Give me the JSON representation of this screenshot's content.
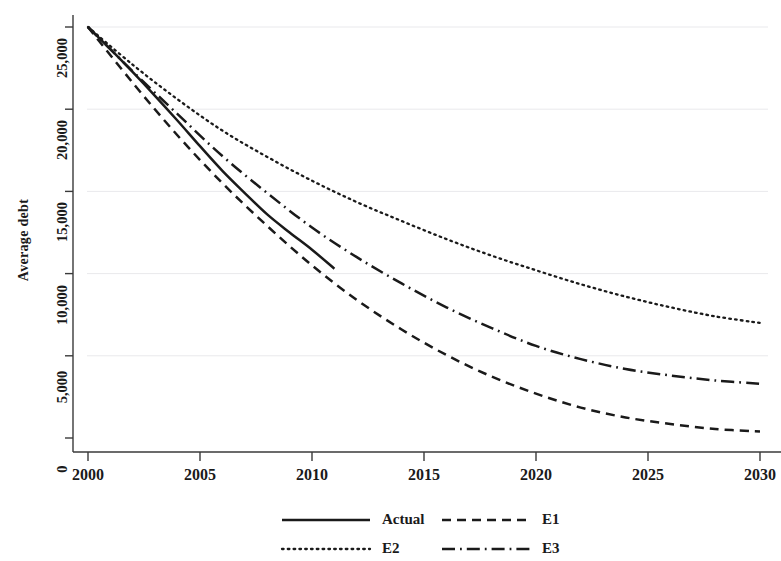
{
  "chart_data": {
    "type": "line",
    "title": "",
    "xlabel": "",
    "ylabel": "Average debt",
    "xlim": [
      2000,
      2030
    ],
    "ylim": [
      0,
      25000
    ],
    "grid": true,
    "grid_axis": "y",
    "legend_position": "bottom",
    "x_ticks": [
      "2000",
      "2005",
      "2010",
      "2015",
      "2020",
      "2025",
      "2030"
    ],
    "x_tick_values": [
      2000,
      2005,
      2010,
      2015,
      2020,
      2025,
      2030
    ],
    "y_ticks": [
      "0",
      "5,000",
      "10,000",
      "15,000",
      "20,000",
      "25,000"
    ],
    "y_tick_values": [
      0,
      5000,
      10000,
      15000,
      20000,
      25000
    ],
    "series": [
      {
        "name": "Actual",
        "style": "solid",
        "color": "#1a1a1a",
        "x": [
          2000,
          2001,
          2002,
          2003,
          2004,
          2005,
          2006,
          2007,
          2008,
          2009,
          2010,
          2011
        ],
        "values": [
          25000,
          23650,
          22250,
          20800,
          19300,
          17750,
          16250,
          14900,
          13600,
          12500,
          11450,
          10300
        ]
      },
      {
        "name": "E1",
        "style": "dashed",
        "color": "#1a1a1a",
        "x": [
          2000,
          2002,
          2004,
          2006,
          2008,
          2010,
          2012,
          2014,
          2016,
          2018,
          2020,
          2022,
          2024,
          2026,
          2028,
          2030
        ],
        "values": [
          25000,
          21600,
          18400,
          15500,
          12900,
          10500,
          8400,
          6600,
          5050,
          3750,
          2700,
          1850,
          1250,
          850,
          550,
          400
        ]
      },
      {
        "name": "E2",
        "style": "dotted",
        "color": "#1a1a1a",
        "x": [
          2000,
          2002,
          2004,
          2006,
          2008,
          2010,
          2012,
          2014,
          2016,
          2018,
          2020,
          2022,
          2024,
          2026,
          2028,
          2030
        ],
        "values": [
          25000,
          22700,
          20600,
          18700,
          17100,
          15650,
          14350,
          13200,
          12100,
          11100,
          10200,
          9350,
          8600,
          7950,
          7400,
          7000
        ]
      },
      {
        "name": "E3",
        "style": "dashdot",
        "color": "#1a1a1a",
        "x": [
          2000,
          2002,
          2004,
          2006,
          2008,
          2010,
          2012,
          2014,
          2016,
          2018,
          2020,
          2022,
          2024,
          2026,
          2028,
          2030
        ],
        "values": [
          25000,
          22300,
          19700,
          17150,
          14900,
          12800,
          11000,
          9400,
          7950,
          6700,
          5600,
          4800,
          4200,
          3800,
          3500,
          3300
        ]
      }
    ],
    "legend": [
      "Actual",
      "E1",
      "E2",
      "E3"
    ]
  },
  "legend_items": [
    {
      "label": "Actual",
      "style": "solid"
    },
    {
      "label": "E1",
      "style": "dashed"
    },
    {
      "label": "E2",
      "style": "dotted"
    },
    {
      "label": "E3",
      "style": "dashdot"
    }
  ],
  "colors": {
    "line": "#1a1a1a",
    "axis": "#3a3a3a",
    "grid": "#e9e9ec",
    "background": "#ffffff"
  }
}
